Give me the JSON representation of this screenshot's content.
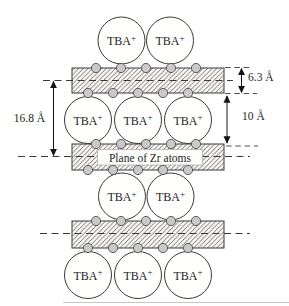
{
  "labels": {
    "tba_base": "TBA",
    "tba_charge": "+",
    "zr_plane": "Plane of Zr atoms",
    "layer_thickness": "6.3 Å",
    "gallery_height": "10 Å",
    "repeat_distance": "16.8 Å"
  },
  "structure": {
    "slab_count": 3,
    "atoms_per_slab_edge": 5,
    "cation_rows": [
      2,
      3,
      2,
      3
    ],
    "cation_label": "TBA+"
  },
  "colors": {
    "line": "#3a3a3a",
    "dimension_line": "#141414",
    "atom_fill": "#c9c9c9",
    "atom_stroke": "#4f4f4f",
    "slab_fill": "#f7f6f3",
    "hatch_line": "#4d4a45",
    "background": "#ffffff"
  }
}
